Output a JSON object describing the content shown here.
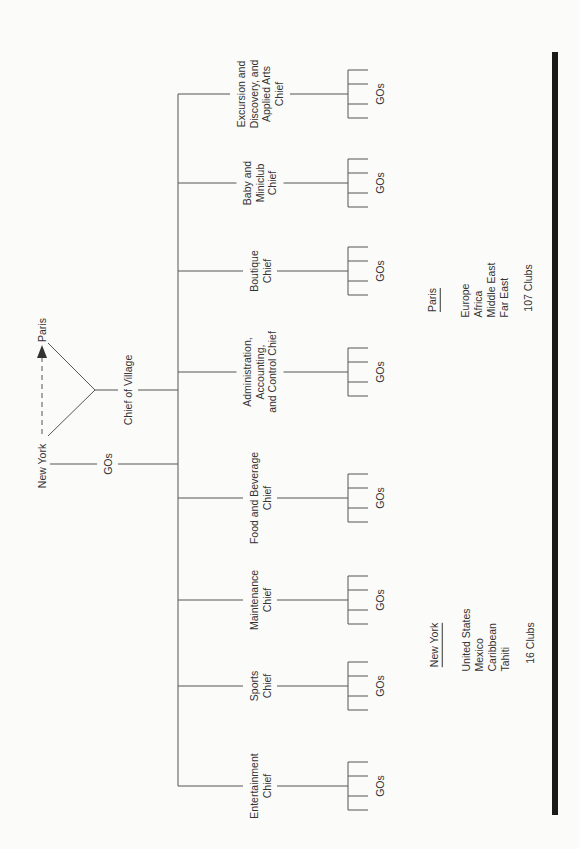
{
  "top": {
    "new_york": "New York",
    "paris": "Paris",
    "gos_label": "GOs",
    "chief_of_village": "Chief of Village"
  },
  "chiefs": [
    {
      "lines": [
        "Entertainment",
        "Chief"
      ],
      "y": 786,
      "gos": "GOs"
    },
    {
      "lines": [
        "Sports",
        "Chief"
      ],
      "y": 686,
      "gos": "GOs"
    },
    {
      "lines": [
        "Maintenance",
        "Chief"
      ],
      "y": 600,
      "gos": "GOs"
    },
    {
      "lines": [
        "Food and Beverage",
        "Chief"
      ],
      "y": 498,
      "gos": "GOs"
    },
    {
      "lines": [
        "Administration,",
        "Accounting,",
        "and Control Chief"
      ],
      "y": 372,
      "gos": "GOs"
    },
    {
      "lines": [
        "Boutique",
        "Chief"
      ],
      "y": 271,
      "gos": "GOs"
    },
    {
      "lines": [
        "Baby and",
        "Miniclub",
        "Chief"
      ],
      "y": 183,
      "gos": "GOs"
    },
    {
      "lines": [
        "Excursion and",
        "Discovery, and",
        "Applied Arts",
        "Chief"
      ],
      "y": 94,
      "gos": "GOs"
    }
  ],
  "regions": {
    "new_york": {
      "title": "New York",
      "areas": [
        "United States",
        "Mexico",
        "Caribbean",
        "Tahiti"
      ],
      "clubs": "16 Clubs"
    },
    "paris": {
      "title": "Paris",
      "areas": [
        "Europe",
        "Africa",
        "Middle East",
        "Far East"
      ],
      "clubs": "107 Clubs"
    }
  }
}
